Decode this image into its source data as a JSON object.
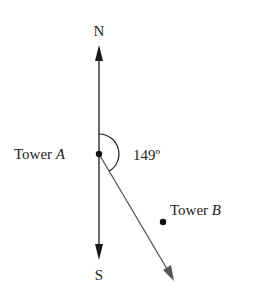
{
  "diagram": {
    "north_label": "N",
    "south_label": "S",
    "tower_a": {
      "word": "Tower",
      "letter": "A"
    },
    "tower_b": {
      "word": "Tower",
      "letter": "B"
    },
    "angle_label": "149º",
    "angle_degrees": 149,
    "colors": {
      "line": "#1a1a1a",
      "bearing_line": "#555555"
    }
  }
}
